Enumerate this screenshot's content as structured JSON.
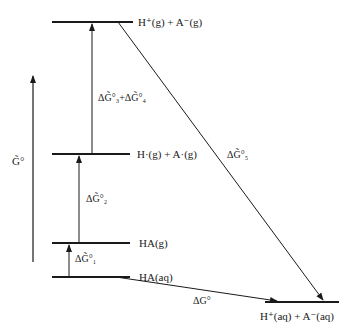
{
  "diagram": {
    "type": "free-energy-level-diagram",
    "axis": {
      "label": "G̃°",
      "direction": "up"
    },
    "levels": [
      {
        "id": "top",
        "label": "H⁺(g) + A⁻(g)"
      },
      {
        "id": "radicals",
        "label": "H·(g) + A·(g)"
      },
      {
        "id": "ha-gas",
        "label": "HA(g)"
      },
      {
        "id": "ha-aq",
        "label": "HA(aq)"
      },
      {
        "id": "ions-aq",
        "label": "H⁺(aq) + A⁻(aq)"
      }
    ],
    "transitions": [
      {
        "from": "ha-aq",
        "to": "ha-gas",
        "label": "ΔG̃°₁"
      },
      {
        "from": "ha-gas",
        "to": "radicals",
        "label": "ΔG̃°₂"
      },
      {
        "from": "radicals",
        "to": "top",
        "label": "ΔG̃°₃+ΔG̃°₄"
      },
      {
        "from": "top",
        "to": "ions-aq",
        "label": "ΔG̃°₅"
      },
      {
        "from": "ha-aq",
        "to": "ions-aq",
        "label": "ΔG°"
      }
    ],
    "line_color": "#1a1a1a"
  }
}
